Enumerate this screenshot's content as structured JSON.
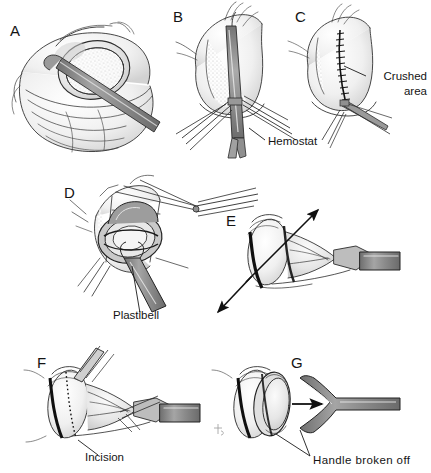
{
  "figure": {
    "background_color": "#ffffff",
    "ink_color": "#1a1a1a",
    "instrument_fill": "#8d8d8d",
    "instrument_fill_light": "#b4b4b4",
    "instrument_fill_dark": "#6e6e6e",
    "tissue_shade": "#d8d8d8",
    "panel_count": 7
  },
  "panels": [
    {
      "letter": "A",
      "name": "foreskin-dilation",
      "caption": "",
      "letter_x": 10,
      "letter_y": 36
    },
    {
      "letter": "B",
      "name": "hemostat-applied",
      "caption": "Hemostat",
      "letter_x": 173,
      "letter_y": 22
    },
    {
      "letter": "C",
      "name": "crushed-dorsal-line",
      "caption": "Crushed area",
      "letter_x": 295,
      "letter_y": 22
    },
    {
      "letter": "D",
      "name": "plastibell-ligature",
      "caption": "Plastibell",
      "letter_x": 64,
      "letter_y": 198
    },
    {
      "letter": "E",
      "name": "ligature-tied-traction",
      "caption": "",
      "letter_x": 226,
      "letter_y": 226
    },
    {
      "letter": "F",
      "name": "foreskin-excision",
      "caption": "Incision",
      "letter_x": 37,
      "letter_y": 368
    },
    {
      "letter": "G",
      "name": "handle-removal",
      "caption": "Handle broken off",
      "letter_x": 291,
      "letter_y": 368
    }
  ],
  "labels": [
    {
      "id": "hemostat",
      "text": "Hemostat",
      "x": 268,
      "y": 145,
      "anchor": "start",
      "panel": "B"
    },
    {
      "id": "crushed-area-line1",
      "text": "Crushed",
      "x": 427,
      "y": 80,
      "anchor": "end",
      "panel": "C"
    },
    {
      "id": "crushed-area-line2",
      "text": "area",
      "x": 427,
      "y": 95,
      "anchor": "end",
      "panel": "C"
    },
    {
      "id": "plastibell",
      "text": "Plastibell",
      "x": 113,
      "y": 319,
      "anchor": "start",
      "panel": "D"
    },
    {
      "id": "incision",
      "text": "Incision",
      "x": 85,
      "y": 461,
      "anchor": "start",
      "panel": "F"
    },
    {
      "id": "handle-broken-off",
      "text": "Handle  broken  off",
      "x": 313,
      "y": 464,
      "anchor": "start",
      "panel": "G"
    }
  ]
}
